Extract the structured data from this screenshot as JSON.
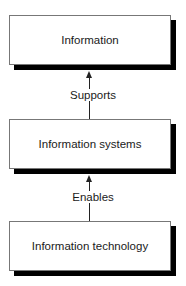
{
  "diagram": {
    "nodes": [
      {
        "id": "information",
        "label": "Information"
      },
      {
        "id": "information-systems",
        "label": "Information systems"
      },
      {
        "id": "information-technology",
        "label": "Information technology"
      }
    ],
    "edges": [
      {
        "from": "information-systems",
        "to": "information",
        "label": "Supports"
      },
      {
        "from": "information-technology",
        "to": "information-systems",
        "label": "Enables"
      }
    ]
  }
}
